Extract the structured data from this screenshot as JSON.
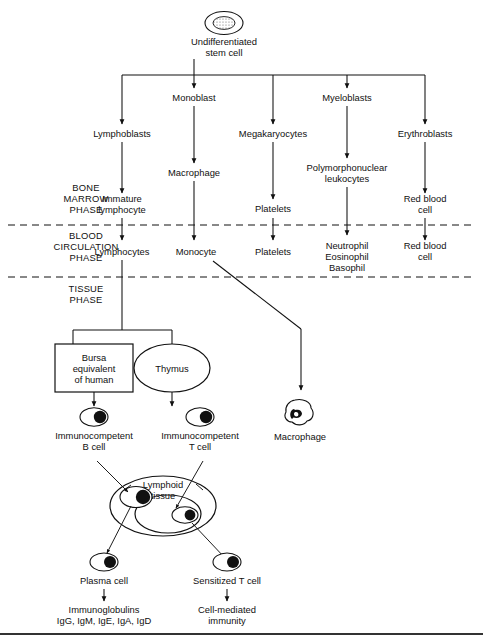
{
  "diagram": {
    "phases": [
      {
        "id": "bone-marrow",
        "line1": "BONE",
        "line2": "MARROW",
        "line3": "PHASE"
      },
      {
        "id": "blood-circulation",
        "line1": "BLOOD",
        "line2": "CIRCULATION",
        "line3": "PHASE"
      },
      {
        "id": "tissue",
        "line1": "TISSUE",
        "line2": "PHASE",
        "line3": ""
      }
    ],
    "nodes": {
      "stem_cell": {
        "line1": "Undifferentiated",
        "line2": "stem cell"
      },
      "monoblast": {
        "line1": "Monoblast",
        "line2": ""
      },
      "myeloblasts": {
        "line1": "Myeloblasts",
        "line2": ""
      },
      "lymphoblasts": {
        "line1": "Lymphoblasts",
        "line2": ""
      },
      "megakaryocytes": {
        "line1": "Megakaryocytes",
        "line2": ""
      },
      "erythroblasts": {
        "line1": "Erythroblasts",
        "line2": ""
      },
      "macrophage_marrow": {
        "line1": "Macrophage",
        "line2": ""
      },
      "pmn_leukocytes": {
        "line1": "Polymorphonuclear",
        "line2": "leukocytes"
      },
      "immature_lymphocyte": {
        "line1": "Immature",
        "line2": "lymphocyte"
      },
      "platelets_marrow": {
        "line1": "Platelets",
        "line2": ""
      },
      "red_blood_cell_marrow": {
        "line1": "Red blood",
        "line2": "cell"
      },
      "lymphocytes": {
        "line1": "Lymphocytes",
        "line2": ""
      },
      "monocyte": {
        "line1": "Monocyte",
        "line2": ""
      },
      "platelets_blood": {
        "line1": "Platelets",
        "line2": ""
      },
      "granulocytes": {
        "line1": "Neutrophil",
        "line2": "Eosinophil",
        "line3": "Basophil"
      },
      "red_blood_cell_blood": {
        "line1": "Red blood",
        "line2": "cell"
      },
      "bursa": {
        "line1": "Bursa",
        "line2": "equivalent",
        "line3": "of human"
      },
      "thymus": {
        "line1": "Thymus",
        "line2": ""
      },
      "immunocompetent_b": {
        "line1": "Immunocompetent",
        "line2": "B cell"
      },
      "immunocompetent_t": {
        "line1": "Immunocompetent",
        "line2": "T cell"
      },
      "macrophage_tissue": {
        "line1": "Macrophage",
        "line2": ""
      },
      "lymphoid_tissue": {
        "line1": "Lymphoid",
        "line2": "tissue"
      },
      "plasma_cell": {
        "line1": "Plasma cell",
        "line2": ""
      },
      "sensitized_t_cell": {
        "line1": "Sensitized T cell",
        "line2": ""
      },
      "immunoglobulins": {
        "line1": "Immunoglobulins",
        "line2": "IgG, IgM, IgE, IgA, IgD"
      },
      "cell_mediated_immunity": {
        "line1": "Cell-mediated",
        "line2": "immunity"
      }
    },
    "colors": {
      "ink": "#111111",
      "paper": "#ffffff",
      "rule": "#333333"
    }
  }
}
